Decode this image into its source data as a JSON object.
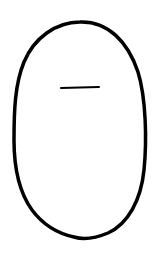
{
  "drawing": {
    "description": "Hand-drawn oval outline with a short horizontal line near the top",
    "background_color": "#ffffff",
    "stroke_color": "#000000",
    "oval": {
      "cx": 80,
      "cy": 130,
      "rx": 66,
      "ry": 108,
      "stroke_width": 3.5
    },
    "mark": {
      "x1": 61,
      "y1": 88,
      "x2": 99,
      "y2": 87,
      "stroke_width": 2
    }
  }
}
